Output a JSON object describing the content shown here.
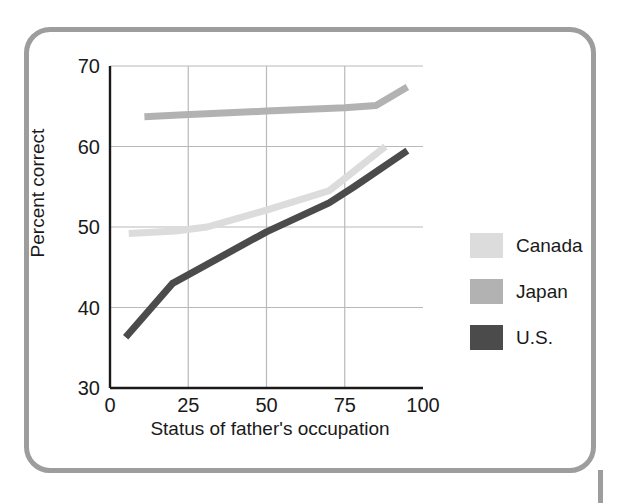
{
  "figure": {
    "frame_color": "#9d9d9d",
    "background": "#ffffff"
  },
  "chart_data": {
    "type": "line",
    "title": "",
    "xlabel": "Status of father's occupation",
    "ylabel": "Percent correct",
    "xlim": [
      0,
      100
    ],
    "ylim": [
      30,
      70
    ],
    "xticks": [
      "0",
      "25",
      "50",
      "75",
      "100"
    ],
    "xtick_values": [
      0,
      25,
      50,
      75,
      100
    ],
    "yticks": [
      "30",
      "40",
      "50",
      "60",
      "70"
    ],
    "ytick_values": [
      30,
      40,
      50,
      60,
      70
    ],
    "grid": true,
    "grid_color": "#b9b9b9",
    "legend_position": "right",
    "series": [
      {
        "name": "Canada",
        "color": "#dcdcdc",
        "x": [
          6,
          21,
          31,
          50,
          70,
          88
        ],
        "y": [
          49.2,
          49.5,
          50.0,
          52.1,
          54.5,
          60.0
        ]
      },
      {
        "name": "Japan",
        "color": "#b2b2b2",
        "x": [
          11,
          22,
          50,
          75,
          85,
          95
        ],
        "y": [
          63.7,
          63.9,
          64.4,
          64.8,
          65.1,
          67.4
        ]
      },
      {
        "name": "U.S.",
        "color": "#4b4b4b",
        "x": [
          5,
          20,
          50,
          70,
          78,
          95
        ],
        "y": [
          36.3,
          43.0,
          49.4,
          53.0,
          55.0,
          59.5
        ]
      }
    ]
  },
  "legend": {
    "items": [
      {
        "label": "Canada",
        "color": "#dcdcdc"
      },
      {
        "label": "Japan",
        "color": "#b2b2b2"
      },
      {
        "label": "U.S.",
        "color": "#4b4b4b"
      }
    ]
  }
}
